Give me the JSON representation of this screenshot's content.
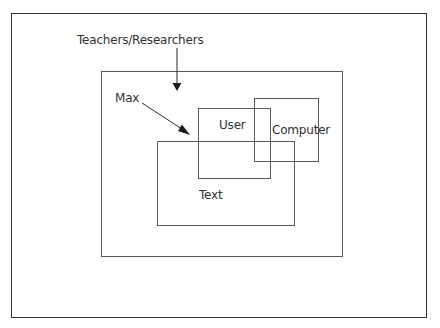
{
  "diagram": {
    "type": "nested-boxes",
    "labels": {
      "teachers_researchers": "Teachers/Researchers",
      "max": "Max",
      "user": "User",
      "computer": "Computer",
      "text": "Text"
    },
    "boxes": [
      {
        "id": "outer-frame",
        "x": 11,
        "y": 13,
        "w": 416,
        "h": 305
      },
      {
        "id": "teachers-researchers",
        "x": 101,
        "y": 71,
        "w": 242,
        "h": 186
      },
      {
        "id": "computer",
        "x": 254,
        "y": 98,
        "w": 65,
        "h": 64
      },
      {
        "id": "user",
        "x": 198,
        "y": 108,
        "w": 73,
        "h": 71
      },
      {
        "id": "text",
        "x": 157,
        "y": 141,
        "w": 138,
        "h": 85
      }
    ],
    "arrows": [
      {
        "from": "Teachers/Researchers label",
        "to": "Teachers/Researchers box",
        "x1": 177,
        "y1": 48,
        "x2": 177,
        "y2": 90
      },
      {
        "from": "Max label",
        "to": "User/Text intersection",
        "x1": 142,
        "y1": 103,
        "x2": 190,
        "y2": 134
      }
    ],
    "colors": {
      "line": "#5a5a5a",
      "frame": "#333333",
      "text": "#333333",
      "background": "#ffffff"
    }
  }
}
